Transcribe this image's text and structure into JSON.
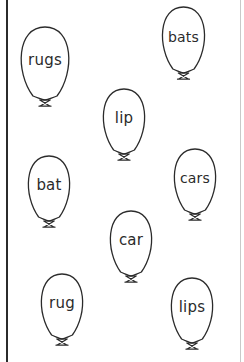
{
  "page": {
    "background_color": "#ffffff",
    "ink_color": "#2b2b2b",
    "left_rule_color": "#2b2b2b",
    "right_rule_color": "#c9c9c9",
    "width": 244,
    "height": 362
  },
  "balloons": [
    {
      "word": "rugs",
      "x": 14,
      "y": 26,
      "w": 62,
      "h": 70,
      "font_size": 15
    },
    {
      "word": "bats",
      "x": 156,
      "y": 6,
      "w": 55,
      "h": 63,
      "font_size": 14
    },
    {
      "word": "lip",
      "x": 97,
      "y": 88,
      "w": 54,
      "h": 62,
      "font_size": 15
    },
    {
      "word": "cars",
      "x": 168,
      "y": 148,
      "w": 54,
      "h": 62,
      "font_size": 14
    },
    {
      "word": "bat",
      "x": 22,
      "y": 155,
      "w": 54,
      "h": 62,
      "font_size": 15
    },
    {
      "word": "car",
      "x": 104,
      "y": 210,
      "w": 54,
      "h": 62,
      "font_size": 15
    },
    {
      "word": "rug",
      "x": 35,
      "y": 273,
      "w": 54,
      "h": 62,
      "font_size": 15
    },
    {
      "word": "lips",
      "x": 165,
      "y": 277,
      "w": 54,
      "h": 62,
      "font_size": 15
    }
  ]
}
